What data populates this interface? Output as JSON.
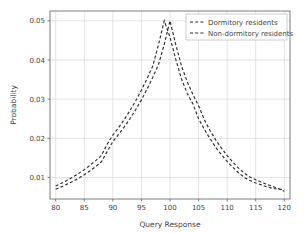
{
  "chart_data": {
    "type": "line",
    "title": "",
    "xlabel": "Query Response",
    "ylabel": "Probability",
    "xlim": [
      79,
      121
    ],
    "ylim": [
      0.0045,
      0.0525
    ],
    "xticks": [
      80,
      85,
      90,
      95,
      100,
      105,
      110,
      115,
      120
    ],
    "xtick_labels": [
      "80",
      "85",
      "90",
      "95",
      "100",
      "105",
      "110",
      "115",
      "120"
    ],
    "yticks": [
      0.01,
      0.02,
      0.03,
      0.04,
      0.05
    ],
    "ytick_labels": [
      "0.01",
      "0.02",
      "0.03",
      "0.04",
      "0.05"
    ],
    "grid": true,
    "legend_position": "upper right",
    "line_color": "#2c2c2c",
    "grid_color": "#d7d7d7",
    "series": [
      {
        "name": "Dormitory residents",
        "peak_x": 99,
        "peak_y": 0.05,
        "x": [
          80,
          81,
          82,
          83,
          84,
          85,
          86,
          87,
          88,
          89,
          90,
          91,
          92,
          93,
          94,
          95,
          96,
          97,
          98,
          99,
          100,
          101,
          102,
          103,
          104,
          105,
          106,
          107,
          108,
          109,
          110,
          111,
          112,
          113,
          114,
          115,
          116,
          117,
          118,
          119,
          120
        ],
        "values": [
          0.0078,
          0.0085,
          0.0093,
          0.0101,
          0.011,
          0.012,
          0.0131,
          0.0143,
          0.0156,
          0.0185,
          0.0208,
          0.0227,
          0.0248,
          0.0271,
          0.0296,
          0.0323,
          0.0353,
          0.0385,
          0.044,
          0.05,
          0.0458,
          0.0402,
          0.0352,
          0.0315,
          0.0288,
          0.025,
          0.0223,
          0.0199,
          0.0177,
          0.0158,
          0.0141,
          0.0126,
          0.0112,
          0.01,
          0.0092,
          0.0086,
          0.0081,
          0.0076,
          0.0072,
          0.007,
          0.0069
        ]
      },
      {
        "name": "Non-dormitory residents",
        "peak_x": 100,
        "peak_y": 0.05,
        "x": [
          80,
          81,
          82,
          83,
          84,
          85,
          86,
          87,
          88,
          89,
          90,
          91,
          92,
          93,
          94,
          95,
          96,
          97,
          98,
          99,
          100,
          101,
          102,
          103,
          104,
          105,
          106,
          107,
          108,
          109,
          110,
          111,
          112,
          113,
          114,
          115,
          116,
          117,
          118,
          119,
          120
        ],
        "values": [
          0.007,
          0.0076,
          0.0083,
          0.009,
          0.0098,
          0.0107,
          0.0117,
          0.0128,
          0.014,
          0.0166,
          0.0192,
          0.021,
          0.0229,
          0.025,
          0.0273,
          0.0298,
          0.0326,
          0.0356,
          0.0389,
          0.044,
          0.05,
          0.044,
          0.0385,
          0.0345,
          0.0312,
          0.0283,
          0.0248,
          0.022,
          0.0196,
          0.0175,
          0.0156,
          0.0139,
          0.0124,
          0.0111,
          0.0101,
          0.0094,
          0.0088,
          0.0082,
          0.0077,
          0.0071,
          0.0065
        ]
      }
    ]
  },
  "legend": {
    "entries": [
      {
        "label": "Dormitory residents"
      },
      {
        "label": "Non-dormitory residents"
      }
    ]
  }
}
